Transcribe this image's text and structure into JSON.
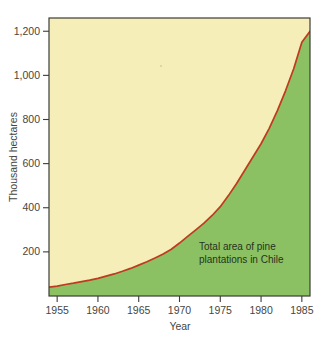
{
  "chart_data": {
    "type": "area",
    "title": "",
    "xlabel": "Year",
    "ylabel": "Thousand hectares",
    "xlim": [
      1954,
      1986
    ],
    "ylim": [
      0,
      1260
    ],
    "grid": false,
    "legend_position": "none",
    "annotations": [
      {
        "name": "series-annotation",
        "line1": "Total area of pine",
        "line2": "plantations in Chile",
        "x": 1977,
        "y": 250
      }
    ],
    "xticks": [
      "1955",
      "1960",
      "1965",
      "1970",
      "1975",
      "1980",
      "1985"
    ],
    "xtick_values": [
      1955,
      1960,
      1965,
      1970,
      1975,
      1980,
      1985
    ],
    "yticks": [
      "200",
      "400",
      "600",
      "800",
      "1,000",
      "1,200"
    ],
    "ytick_values": [
      200,
      400,
      600,
      800,
      1000,
      1200
    ],
    "series": [
      {
        "name": "Total area of pine plantations in Chile",
        "line_color": "#bf3a1e",
        "fill_below_color": "#8cc163",
        "fill_above_color": "#f5eeb8",
        "x": [
          1954,
          1955,
          1956,
          1957,
          1958,
          1959,
          1960,
          1961,
          1962,
          1963,
          1964,
          1965,
          1966,
          1967,
          1968,
          1969,
          1970,
          1971,
          1972,
          1973,
          1974,
          1975,
          1976,
          1977,
          1978,
          1979,
          1980,
          1981,
          1982,
          1983,
          1984,
          1985,
          1986
        ],
        "values": [
          40,
          45,
          52,
          58,
          65,
          72,
          80,
          90,
          100,
          112,
          125,
          140,
          155,
          172,
          190,
          212,
          240,
          270,
          300,
          330,
          365,
          405,
          455,
          510,
          570,
          630,
          690,
          760,
          840,
          930,
          1030,
          1150,
          1200
        ]
      }
    ]
  },
  "axes": {
    "y_axis_title": "Thousand hectares",
    "x_axis_title": "Year"
  },
  "colors": {
    "cream_fill": "#f5eeb8",
    "green_fill": "#8cc163",
    "curve_red": "#bf3a1e",
    "axis_dark": "#3d3d35",
    "page_background": "#ffffff"
  }
}
